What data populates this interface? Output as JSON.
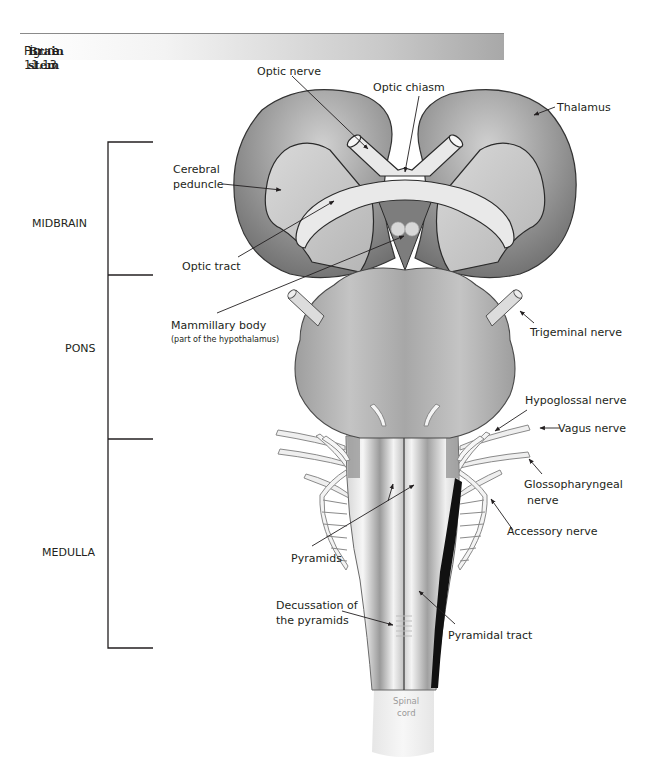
{
  "figure": {
    "number": "Figure 11.13",
    "title": "Brain stem"
  },
  "regions": [
    {
      "name": "MIDBRAIN"
    },
    {
      "name": "PONS"
    },
    {
      "name": "MEDULLA"
    }
  ],
  "labels": {
    "optic_nerve": "Optic nerve",
    "optic_chiasm": "Optic chiasm",
    "thalamus": "Thalamus",
    "cerebral_peduncle_1": "Cerebral",
    "cerebral_peduncle_2": "peduncle",
    "optic_tract": "Optic tract",
    "mammillary_body": "Mammillary body",
    "mammillary_body_note": "(part of the hypothalamus)",
    "trigeminal_nerve": "Trigeminal nerve",
    "hypoglossal_nerve": "Hypoglossal nerve",
    "vagus_nerve": "Vagus nerve",
    "glossopharyngeal_nerve_1": "Glossopharyngeal",
    "glossopharyngeal_nerve_2": "nerve",
    "accessory_nerve": "Accessory nerve",
    "pyramids": "Pyramids",
    "decussation_1": "Decussation of",
    "decussation_2": "the pyramids",
    "pyramidal_tract": "Pyramidal tract",
    "spinal_cord_1": "Spinal",
    "spinal_cord_2": "cord"
  },
  "colors": {
    "thalamus": "#8d8d8d",
    "pons": "#b3b3b3",
    "peduncle": "#c9c9c9",
    "optic": "#e8e8e8",
    "medulla": "#e2e2e2",
    "tract": "#111111",
    "outline": "#2a2a2a"
  }
}
